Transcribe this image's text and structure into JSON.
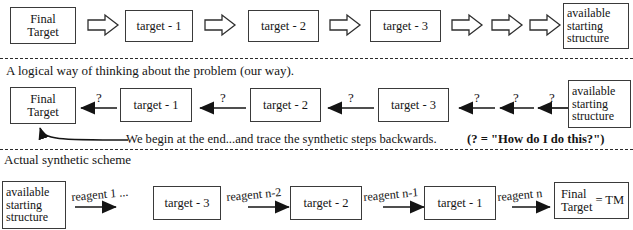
{
  "figure": {
    "title_hidden": "Retrosynthetic analysis vs actual synthetic scheme",
    "rows": [
      {
        "id": "retro-row",
        "kind": "hollow-arrow-chain",
        "boxes": [
          {
            "name": "final-target",
            "lines": [
              "Final",
              "Target"
            ]
          },
          {
            "name": "target-1",
            "lines": [
              "target - 1"
            ]
          },
          {
            "name": "target-2",
            "lines": [
              "target - 2"
            ]
          },
          {
            "name": "target-3",
            "lines": [
              "target - 3"
            ]
          },
          {
            "name": "available-starting-structure",
            "lines": [
              "available",
              "starting",
              "structure"
            ]
          }
        ]
      },
      {
        "id": "logical-row",
        "kind": "question-arrow-chain",
        "caption": "A logical way of thinking about the problem (our way).",
        "boxes": [
          {
            "name": "final-target",
            "lines": [
              "Final",
              "Target"
            ]
          },
          {
            "name": "target-1",
            "lines": [
              "target - 1"
            ]
          },
          {
            "name": "target-2",
            "lines": [
              "target - 2"
            ]
          },
          {
            "name": "target-3",
            "lines": [
              "target - 3"
            ]
          },
          {
            "name": "available-starting-structure",
            "lines": [
              "available",
              "starting",
              "structure"
            ]
          }
        ],
        "question_marks": [
          "?",
          "?",
          "?",
          "?",
          "?",
          "?"
        ],
        "annotation": "We begin at the end...and trace the synthetic steps backwards.",
        "annotation_bold": "(? = \"How do I do this?\")"
      },
      {
        "id": "actual-row",
        "kind": "reagent-arrow-chain",
        "caption": "Actual synthetic scheme",
        "boxes": [
          {
            "name": "available-starting-structure",
            "lines": [
              "available",
              "starting",
              "structure"
            ]
          },
          {
            "name": "target-3",
            "lines": [
              "target - 3"
            ]
          },
          {
            "name": "target-2",
            "lines": [
              "target - 2"
            ]
          },
          {
            "name": "target-1",
            "lines": [
              "target - 1"
            ]
          },
          {
            "name": "final-target-tm",
            "lines": [
              "Final",
              "Target"
            ],
            "suffix": "= TM"
          }
        ],
        "reagents": [
          "reagent 1 ...",
          "reagent n-2",
          "reagent n-1",
          "reagent n"
        ]
      }
    ],
    "colors": {
      "box_border": "#3a3a3a",
      "ink": "#141414",
      "divider": "#2b2b2b",
      "background": "#ffffff"
    }
  }
}
